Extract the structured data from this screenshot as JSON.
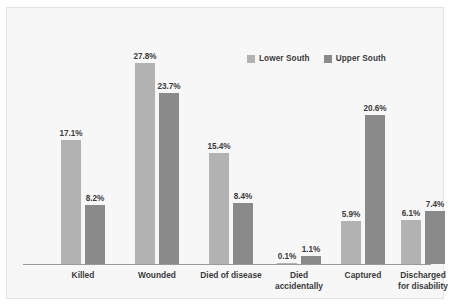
{
  "chart_data": {
    "type": "bar",
    "title": "",
    "xlabel": "",
    "ylabel": "",
    "ylim": [
      0,
      30
    ],
    "grid": false,
    "legend_position": "top-right",
    "categories": [
      "Killed",
      "Wounded",
      "Died of disease",
      "Died accidentally",
      "Captured",
      "Discharged for disability"
    ],
    "category_lines": [
      [
        "Killed"
      ],
      [
        "Wounded"
      ],
      [
        "Died of disease"
      ],
      [
        "Died",
        "accidentally"
      ],
      [
        "Captured"
      ],
      [
        "Discharged",
        "for disability"
      ]
    ],
    "series": [
      {
        "name": "Lower South",
        "color": "#b2b2b2",
        "values": [
          17.1,
          27.8,
          15.4,
          0.1,
          5.9,
          6.1
        ],
        "labels": [
          "17.1%",
          "27.8%",
          "15.4%",
          "0.1%",
          "5.9%",
          "6.1%"
        ]
      },
      {
        "name": "Upper South",
        "color": "#8a8a8a",
        "values": [
          8.2,
          23.7,
          8.4,
          1.1,
          20.6,
          7.4
        ],
        "labels": [
          "8.2%",
          "23.7%",
          "8.4%",
          "1.1%",
          "20.6%",
          "7.4%"
        ]
      }
    ]
  },
  "legend": {
    "entries": [
      {
        "label": "Lower South",
        "color": "#b2b2b2"
      },
      {
        "label": "Upper South",
        "color": "#8a8a8a"
      }
    ]
  },
  "colors": {
    "panel_background": "#f7f7f7",
    "panel_border": "#e2e2e2",
    "axis_line": "#9a9a9a",
    "text": "#3b3b3b",
    "lower_south": "#b2b2b2",
    "upper_south": "#8a8a8a"
  }
}
